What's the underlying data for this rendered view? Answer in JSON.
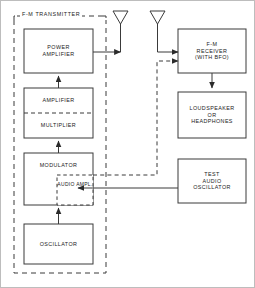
{
  "figure": {
    "type": "block-diagram",
    "background_color": "#ffffff",
    "line_color": "#333333"
  },
  "transmitter_group": {
    "label": "F-M TRANSMITTER",
    "border_style": "dashed"
  },
  "blocks": {
    "power_amplifier": {
      "line1": "POWER",
      "line2": "AMPLIFIER"
    },
    "amplifier": {
      "line1": "AMPLIFIER"
    },
    "multiplier": {
      "line1": "MULTIPLIER"
    },
    "modulator": {
      "line1": "MODULATOR"
    },
    "audio_ampl": {
      "line1": "AUDIO",
      "line2": "AMPL."
    },
    "oscillator": {
      "line1": "OSCILLATOR"
    },
    "fm_receiver": {
      "line1": "F-M",
      "line2": "RECEIVER",
      "line3": "(WITH  BFO)"
    },
    "loudspeaker": {
      "line1": "LOUDSPEAKER",
      "line2": "OR",
      "line3": "HEADPHONES"
    },
    "test_audio_oscillator": {
      "line1": "TEST",
      "line2": "AUDIO",
      "line3": "OSCILLATOR"
    }
  },
  "icons": {
    "transmit_antenna": "antenna-icon",
    "receive_antenna": "antenna-icon"
  },
  "connections": [
    {
      "name": "oscillator-to-modulator",
      "style": "solid",
      "direction": "up"
    },
    {
      "name": "modulator-to-multiplier",
      "style": "solid",
      "direction": "up"
    },
    {
      "name": "amplifier-to-power-amplifier",
      "style": "solid",
      "direction": "up"
    },
    {
      "name": "power-amplifier-to-transmit-antenna",
      "style": "solid",
      "direction": "right"
    },
    {
      "name": "receive-antenna-to-fm-receiver",
      "style": "solid",
      "direction": "right"
    },
    {
      "name": "modulator-to-fm-receiver",
      "style": "dashed",
      "direction": "right"
    },
    {
      "name": "fm-receiver-to-loudspeaker",
      "style": "solid",
      "direction": "down"
    },
    {
      "name": "test-audio-oscillator-to-audio-ampl",
      "style": "solid",
      "direction": "left"
    }
  ]
}
